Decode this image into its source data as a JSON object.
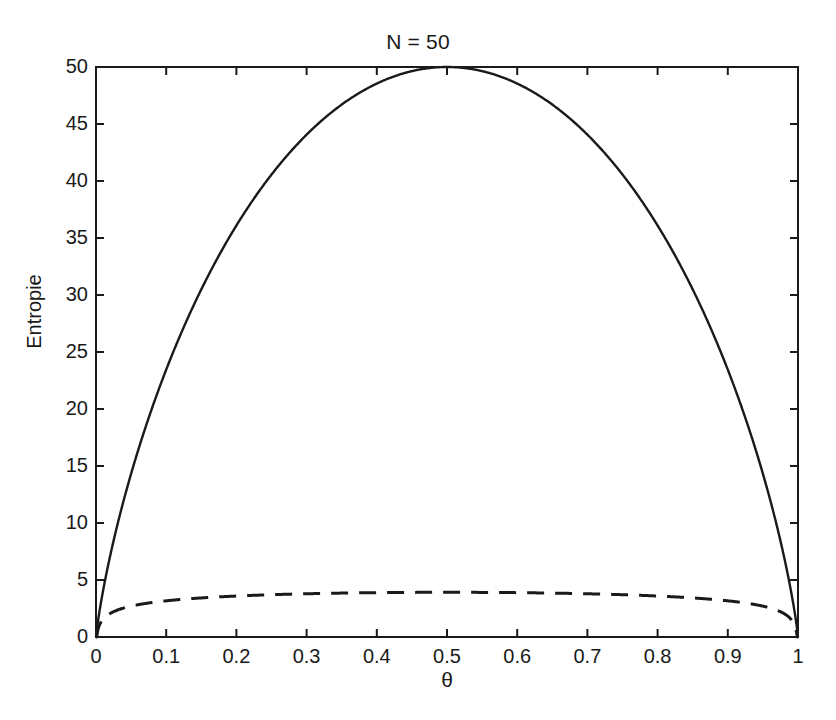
{
  "figure": {
    "title": "N = 50",
    "background_color": "#ffffff",
    "axis_color": "#1a1a1a",
    "line_color": "#1a1a1a"
  },
  "axes": {
    "xlabel": "θ",
    "ylabel": "Entropie",
    "xticks": [
      "0",
      "0.1",
      "0.2",
      "0.3",
      "0.4",
      "0.5",
      "0.6",
      "0.7",
      "0.8",
      "0.9",
      "1"
    ],
    "yticks": [
      "0",
      "5",
      "10",
      "15",
      "20",
      "25",
      "30",
      "35",
      "40",
      "45",
      "50"
    ],
    "xlim": [
      0,
      1
    ],
    "ylim": [
      0,
      50
    ],
    "grid": false,
    "box": true
  },
  "chart_data": {
    "type": "line",
    "title": "N = 50",
    "xlabel": "θ",
    "ylabel": "Entropie",
    "xlim": [
      0,
      1
    ],
    "ylim": [
      0,
      50
    ],
    "grid": false,
    "legend": null,
    "legend_position": "none",
    "x": [
      0,
      0.005,
      0.01,
      0.02,
      0.03,
      0.04,
      0.05,
      0.06,
      0.08,
      0.1,
      0.12,
      0.14,
      0.16,
      0.18,
      0.2,
      0.22,
      0.25,
      0.28,
      0.3,
      0.32,
      0.35,
      0.38,
      0.4,
      0.42,
      0.45,
      0.48,
      0.5,
      0.52,
      0.55,
      0.58,
      0.6,
      0.62,
      0.65,
      0.68,
      0.7,
      0.72,
      0.75,
      0.78,
      0.8,
      0.82,
      0.84,
      0.86,
      0.88,
      0.9,
      0.92,
      0.94,
      0.95,
      0.96,
      0.97,
      0.98,
      0.99,
      0.995,
      1
    ],
    "series": [
      {
        "name": "N*H(theta)",
        "style": "solid",
        "linewidth": 2.4,
        "values": [
          0,
          1.56,
          2.62,
          4.38,
          5.88,
          7.22,
          8.45,
          9.6,
          11.7,
          13.6,
          15.3,
          16.9,
          18.5,
          19.9,
          21.3,
          22.6,
          24.4,
          26.0,
          27.0,
          27.9,
          29.2,
          30.3,
          30.9,
          31.5,
          32.2,
          32.6,
          32.7,
          32.6,
          32.2,
          31.5,
          30.9,
          30.3,
          29.2,
          27.9,
          27.0,
          26.0,
          24.4,
          22.6,
          21.3,
          19.9,
          18.5,
          16.9,
          15.3,
          13.6,
          11.7,
          9.6,
          8.45,
          7.22,
          5.88,
          4.38,
          2.62,
          1.56,
          0
        ],
        "values_nats_scaled": [
          0,
          1.56,
          2.62,
          4.38,
          5.88,
          7.22,
          8.45,
          9.6,
          11.7,
          13.6,
          15.3,
          16.9,
          18.5,
          19.9,
          21.3,
          22.6,
          24.4,
          26.0,
          27.0,
          27.9,
          29.2,
          30.3,
          30.9,
          31.5,
          32.2,
          32.6,
          32.7,
          32.6,
          32.2,
          31.5,
          30.9,
          30.3,
          29.2,
          27.9,
          27.0,
          26.0,
          24.4,
          22.6,
          21.3,
          19.9,
          18.5,
          16.9,
          15.3,
          13.6,
          11.7,
          9.6,
          8.45,
          7.22,
          5.88,
          4.38,
          2.62,
          1.56,
          0
        ],
        "peak": {
          "x": 0.5,
          "y": 50
        },
        "endpoints": [
          {
            "x": 0,
            "y": 0
          },
          {
            "x": 1,
            "y": 0
          }
        ],
        "description": "Entropie der Binomialverteilung, Maximum 50 bei theta = 0.5"
      },
      {
        "name": "Gauss-Approximation",
        "style": "dashed",
        "linewidth": 3.0,
        "dash_pattern": [
          17,
          11
        ],
        "values": [
          0,
          1.0,
          1.4,
          1.8,
          2.05,
          2.2,
          2.35,
          2.45,
          2.6,
          2.75,
          2.9,
          3.0,
          3.1,
          3.2,
          3.3,
          3.4,
          3.5,
          3.6,
          3.65,
          3.7,
          3.78,
          3.84,
          3.87,
          3.89,
          3.91,
          3.92,
          3.92,
          3.92,
          3.91,
          3.89,
          3.87,
          3.84,
          3.78,
          3.7,
          3.65,
          3.6,
          3.5,
          3.4,
          3.3,
          3.2,
          3.1,
          3.0,
          2.9,
          2.75,
          2.6,
          2.45,
          2.35,
          2.2,
          2.05,
          1.8,
          1.4,
          1.0,
          0
        ],
        "peak": {
          "x": 0.5,
          "y": 3.92
        },
        "endpoints": [
          {
            "x": 0,
            "y": 0
          },
          {
            "x": 1,
            "y": 0
          }
        ],
        "description": "Flache gestrichelte Kurve, Plateau bei etwa 3.9"
      }
    ]
  }
}
